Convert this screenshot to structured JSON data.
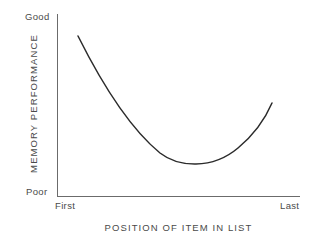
{
  "chart_data": {
    "type": "line",
    "title": "",
    "xlabel": "POSITION OF ITEM IN LIST",
    "ylabel": "MEMORY PERFORMANCE",
    "x_tick_labels": [
      "First",
      "Last"
    ],
    "y_tick_labels": [
      "Poor",
      "Good"
    ],
    "grid": false,
    "legend": "none",
    "xlim": [
      "First",
      "Last"
    ],
    "ylim": [
      "Poor",
      "Good"
    ],
    "series": [
      {
        "name": "Serial position curve",
        "x": [
          0.09,
          0.18,
          0.27,
          0.36,
          0.45,
          0.54,
          0.63,
          0.72,
          0.81,
          0.9
        ],
        "y": [
          0.88,
          0.74,
          0.59,
          0.45,
          0.33,
          0.24,
          0.18,
          0.19,
          0.3,
          0.51
        ],
        "points_px": [
          [
            78,
            36
          ],
          [
            100,
            82
          ],
          [
            125,
            110
          ],
          [
            150,
            140
          ],
          [
            170,
            158
          ],
          [
            195,
            167
          ],
          [
            225,
            158
          ],
          [
            250,
            135
          ],
          [
            272,
            103
          ]
        ]
      }
    ],
    "curve_path": "M 78 36 C 104 88, 132 130, 160 153 C 178 167, 212 170, 238 148 C 256 133, 266 117, 272 103",
    "axes_px": {
      "y_axis": {
        "x": 57,
        "y_top": 14,
        "y_bottom": 196
      },
      "x_axis": {
        "y": 196,
        "x_left": 57,
        "x_right": 300
      }
    },
    "colors": {
      "curve": "#2b2b2b",
      "axis": "#6b6b6b",
      "text": "#4a4a4a",
      "background": "#ffffff"
    }
  },
  "labels": {
    "y_good": "Good",
    "y_poor": "Poor",
    "x_first": "First",
    "x_last": "Last",
    "x_title": "POSITION OF ITEM IN LIST",
    "y_title": "MEMORY PERFORMANCE"
  }
}
